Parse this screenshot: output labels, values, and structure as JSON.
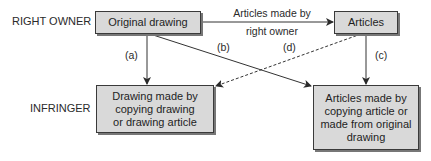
{
  "diagram": {
    "rows": {
      "top": "RIGHT OWNER",
      "bottom": "INFRINGER"
    },
    "nodes": {
      "original_drawing": "Original drawing",
      "articles": "Articles",
      "infringer_drawing": [
        "Drawing made by",
        "copying drawing",
        "or drawing article"
      ],
      "infringer_articles": [
        "Articles made by",
        "copying article or",
        "made from original",
        "drawing"
      ]
    },
    "edges": {
      "top_arrow_line1": "Articles made by",
      "top_arrow_line2": "right owner",
      "a": "(a)",
      "b": "(b)",
      "c": "(c)",
      "d": "(d)"
    },
    "colors": {
      "box_fill": "#d9d9d9",
      "box_border": "#3a3a3a",
      "line": "#333333"
    }
  }
}
